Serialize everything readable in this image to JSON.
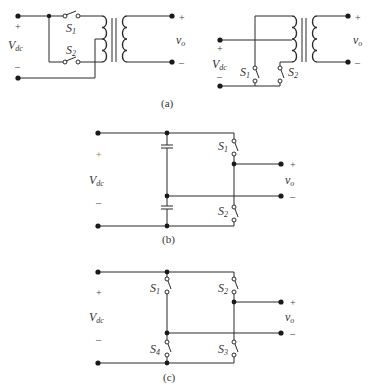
{
  "figures": {
    "a": {
      "caption": "(a)",
      "left": {
        "source_label": "V",
        "source_sub": "dc",
        "plus": "+",
        "minus": "–",
        "switches": [
          {
            "label": "S",
            "sub": "1"
          },
          {
            "label": "S",
            "sub": "2"
          }
        ],
        "output_label": "v",
        "output_sub": "o",
        "out_plus": "+",
        "out_minus": "–"
      },
      "right": {
        "source_label": "V",
        "source_sub": "dc",
        "plus": "+",
        "minus": "–",
        "switches": [
          {
            "label": "S",
            "sub": "1"
          },
          {
            "label": "S",
            "sub": "2"
          }
        ],
        "output_label": "v",
        "output_sub": "o",
        "out_plus": "+",
        "out_minus": "–"
      }
    },
    "b": {
      "caption": "(b)",
      "source_label": "V",
      "source_sub": "dc",
      "plus": "+",
      "minus": "–",
      "switches": [
        {
          "label": "S",
          "sub": "1"
        },
        {
          "label": "S",
          "sub": "2"
        }
      ],
      "output_label": "v",
      "output_sub": "o",
      "out_plus": "+",
      "out_minus": "–"
    },
    "c": {
      "caption": "(c)",
      "source_label": "V",
      "source_sub": "dc",
      "plus": "+",
      "minus": "–",
      "switches": [
        {
          "label": "S",
          "sub": "1"
        },
        {
          "label": "S",
          "sub": "2"
        },
        {
          "label": "S",
          "sub": "3"
        },
        {
          "label": "S",
          "sub": "4"
        }
      ],
      "output_label": "v",
      "output_sub": "o",
      "out_plus": "+",
      "out_minus": "–"
    }
  }
}
